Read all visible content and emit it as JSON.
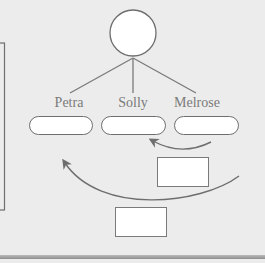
{
  "diagram": {
    "type": "family-tree-with-transfer-arrows",
    "root_node": {
      "shape": "circle",
      "label": ""
    },
    "children": [
      {
        "label": "Petra",
        "box_value": ""
      },
      {
        "label": "Solly",
        "box_value": ""
      },
      {
        "label": "Melrose",
        "box_value": ""
      }
    ],
    "arrows": [
      {
        "from": "Melrose",
        "to": "Solly",
        "label_box": ""
      },
      {
        "from": "Melrose",
        "to": "Petra",
        "label_box": ""
      }
    ],
    "colors": {
      "background": "#ececec",
      "stroke": "#6e6e6e",
      "label_text": "#7b7b7b",
      "box_fill": "#ffffff",
      "bottom_rule": "#9a9a9a"
    }
  }
}
